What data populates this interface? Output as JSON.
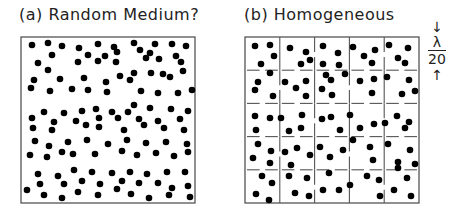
{
  "panel_a": {
    "title": "(a) Random Medium?",
    "box": {
      "x": 21,
      "y": 37,
      "w": 174,
      "h": 166
    },
    "dots": [
      [
        32,
        45
      ],
      [
        48,
        43
      ],
      [
        62,
        46
      ],
      [
        79,
        48
      ],
      [
        98,
        44
      ],
      [
        114,
        47
      ],
      [
        134,
        43
      ],
      [
        155,
        44
      ],
      [
        172,
        44
      ],
      [
        186,
        46
      ],
      [
        52,
        55
      ],
      [
        88,
        55
      ],
      [
        105,
        56
      ],
      [
        117,
        52
      ],
      [
        150,
        53
      ],
      [
        176,
        56
      ],
      [
        140,
        50
      ],
      [
        38,
        63
      ],
      [
        78,
        62
      ],
      [
        98,
        61
      ],
      [
        116,
        62
      ],
      [
        159,
        59
      ],
      [
        181,
        62
      ],
      [
        146,
        58
      ],
      [
        48,
        70
      ],
      [
        183,
        71
      ],
      [
        134,
        73
      ],
      [
        151,
        73
      ],
      [
        163,
        74
      ],
      [
        120,
        76
      ],
      [
        34,
        80
      ],
      [
        60,
        79
      ],
      [
        84,
        78
      ],
      [
        106,
        82
      ],
      [
        130,
        80
      ],
      [
        170,
        77
      ],
      [
        31,
        88
      ],
      [
        50,
        91
      ],
      [
        72,
        89
      ],
      [
        88,
        90
      ],
      [
        107,
        92
      ],
      [
        141,
        91
      ],
      [
        158,
        93
      ],
      [
        178,
        93
      ],
      [
        192,
        90
      ],
      [
        44,
        112
      ],
      [
        64,
        113
      ],
      [
        82,
        111
      ],
      [
        96,
        109
      ],
      [
        112,
        112
      ],
      [
        128,
        112
      ],
      [
        134,
        105
      ],
      [
        150,
        108
      ],
      [
        171,
        109
      ],
      [
        188,
        111
      ],
      [
        32,
        118
      ],
      [
        54,
        122
      ],
      [
        76,
        121
      ],
      [
        99,
        118
      ],
      [
        118,
        118
      ],
      [
        139,
        119
      ],
      [
        158,
        121
      ],
      [
        180,
        119
      ],
      [
        33,
        128
      ],
      [
        52,
        130
      ],
      [
        86,
        125
      ],
      [
        99,
        127
      ],
      [
        124,
        130
      ],
      [
        144,
        125
      ],
      [
        164,
        128
      ],
      [
        184,
        130
      ],
      [
        35,
        141
      ],
      [
        49,
        146
      ],
      [
        68,
        142
      ],
      [
        87,
        140
      ],
      [
        108,
        144
      ],
      [
        127,
        140
      ],
      [
        146,
        143
      ],
      [
        166,
        142
      ],
      [
        187,
        144
      ],
      [
        30,
        155
      ],
      [
        47,
        157
      ],
      [
        62,
        152
      ],
      [
        73,
        154
      ],
      [
        95,
        154
      ],
      [
        122,
        151
      ],
      [
        137,
        155
      ],
      [
        156,
        153
      ],
      [
        174,
        156
      ],
      [
        188,
        152
      ],
      [
        38,
        174
      ],
      [
        58,
        176
      ],
      [
        74,
        170
      ],
      [
        92,
        172
      ],
      [
        112,
        173
      ],
      [
        130,
        172
      ],
      [
        147,
        174
      ],
      [
        167,
        172
      ],
      [
        185,
        172
      ],
      [
        40,
        184
      ],
      [
        64,
        184
      ],
      [
        82,
        181
      ],
      [
        100,
        184
      ],
      [
        122,
        181
      ],
      [
        139,
        183
      ],
      [
        158,
        183
      ],
      [
        172,
        188
      ],
      [
        188,
        186
      ],
      [
        27,
        190
      ],
      [
        44,
        195
      ],
      [
        62,
        198
      ],
      [
        78,
        192
      ],
      [
        98,
        195
      ],
      [
        117,
        189
      ],
      [
        131,
        194
      ],
      [
        149,
        198
      ],
      [
        169,
        195
      ],
      [
        190,
        197
      ]
    ]
  },
  "panel_b": {
    "title": "(b) Homogeneous",
    "box": {
      "x": 245,
      "y": 37,
      "w": 174,
      "h": 166
    },
    "grid": {
      "rows": 5,
      "cols": 5
    },
    "dots": [
      [
        255,
        46
      ],
      [
        270,
        45
      ],
      [
        274,
        56
      ],
      [
        261,
        64
      ],
      [
        290,
        48
      ],
      [
        306,
        52
      ],
      [
        301,
        64
      ],
      [
        310,
        60
      ],
      [
        323,
        46
      ],
      [
        338,
        53
      ],
      [
        323,
        64
      ],
      [
        339,
        65
      ],
      [
        353,
        47
      ],
      [
        364,
        56
      ],
      [
        375,
        50
      ],
      [
        372,
        63
      ],
      [
        389,
        45
      ],
      [
        408,
        48
      ],
      [
        398,
        58
      ],
      [
        405,
        63
      ],
      [
        258,
        82
      ],
      [
        255,
        90
      ],
      [
        270,
        73
      ],
      [
        273,
        96
      ],
      [
        285,
        82
      ],
      [
        296,
        88
      ],
      [
        306,
        81
      ],
      [
        306,
        96
      ],
      [
        326,
        75
      ],
      [
        322,
        89
      ],
      [
        331,
        80
      ],
      [
        332,
        95
      ],
      [
        345,
        74
      ],
      [
        360,
        81
      ],
      [
        374,
        79
      ],
      [
        372,
        93
      ],
      [
        387,
        77
      ],
      [
        409,
        80
      ],
      [
        402,
        94
      ],
      [
        415,
        91
      ],
      [
        255,
        116
      ],
      [
        270,
        118
      ],
      [
        256,
        130
      ],
      [
        281,
        118
      ],
      [
        289,
        131
      ],
      [
        302,
        115
      ],
      [
        301,
        128
      ],
      [
        322,
        119
      ],
      [
        331,
        117
      ],
      [
        340,
        130
      ],
      [
        350,
        115
      ],
      [
        360,
        128
      ],
      [
        374,
        124
      ],
      [
        385,
        123
      ],
      [
        397,
        116
      ],
      [
        405,
        128
      ],
      [
        409,
        122
      ],
      [
        258,
        144
      ],
      [
        271,
        151
      ],
      [
        253,
        158
      ],
      [
        270,
        163
      ],
      [
        285,
        152
      ],
      [
        297,
        148
      ],
      [
        291,
        165
      ],
      [
        310,
        155
      ],
      [
        320,
        147
      ],
      [
        330,
        157
      ],
      [
        343,
        150
      ],
      [
        353,
        140
      ],
      [
        370,
        147
      ],
      [
        373,
        160
      ],
      [
        388,
        144
      ],
      [
        398,
        162
      ],
      [
        410,
        150
      ],
      [
        415,
        164
      ],
      [
        262,
        176
      ],
      [
        272,
        183
      ],
      [
        256,
        194
      ],
      [
        269,
        200
      ],
      [
        289,
        176
      ],
      [
        295,
        193
      ],
      [
        307,
        178
      ],
      [
        309,
        196
      ],
      [
        323,
        190
      ],
      [
        329,
        173
      ],
      [
        339,
        190
      ],
      [
        350,
        185
      ],
      [
        367,
        176
      ],
      [
        379,
        180
      ],
      [
        380,
        196
      ],
      [
        394,
        190
      ],
      [
        407,
        178
      ],
      [
        411,
        196
      ],
      [
        398,
        168
      ]
    ],
    "grid_gaps": "partial dividers",
    "scale_label": {
      "numerator": "λ",
      "denominator": "20"
    }
  }
}
